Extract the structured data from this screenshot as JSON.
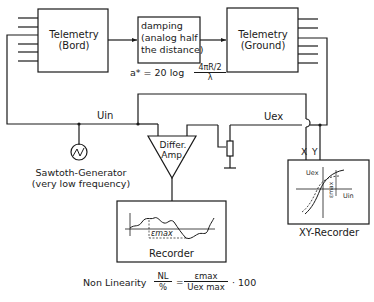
{
  "blocks": {
    "telemetry_bord": {
      "line1": "Telemetry",
      "line2": "(Bord)"
    },
    "damping": {
      "line1": "damping",
      "line2": "(analog half",
      "line3": "the distance)"
    },
    "telemetry_ground": {
      "line1": "Telemetry",
      "line2": "(Ground)"
    },
    "diff_amp": {
      "line1": "Differ.",
      "line2": "Amp."
    },
    "recorder": {
      "label": "Recorder",
      "epsilon_label": "εmax"
    },
    "xy_recorder": {
      "label": "XY-Recorder",
      "y_axis": "Uex",
      "x_axis": "Uin",
      "epsilon_label": "εmax",
      "x_port": "X",
      "y_port": "Y"
    }
  },
  "damping_formula": {
    "lhs": "a* = 20 log",
    "numerator": "4πR/2",
    "denominator": "λ"
  },
  "signals": {
    "u_in": "Uin",
    "u_ex": "Uex"
  },
  "generator": {
    "line1": "Sawtoth-Generator",
    "line2": "(very low frequency)"
  },
  "nonlinearity_formula": {
    "prefix": "Non Linearity",
    "lhs_num": "NL",
    "lhs_den": "%",
    "rhs_num": "εmax",
    "rhs_den": "Uex max",
    "suffix": "· 100"
  }
}
